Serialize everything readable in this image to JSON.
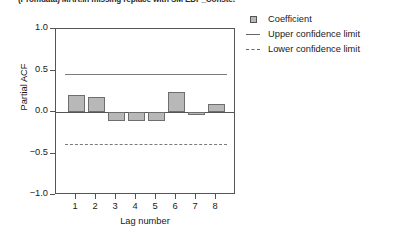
{
  "chart_data": {
    "type": "bar",
    "title": "(Promdata) MAR.ln missing replace with SM EDP_Conste.",
    "xlabel": "Lag number",
    "ylabel": "Partial ACF",
    "categories": [
      "1",
      "2",
      "3",
      "4",
      "5",
      "6",
      "7",
      "8"
    ],
    "values": [
      0.2,
      0.18,
      -0.11,
      -0.11,
      -0.11,
      0.24,
      -0.04,
      0.1
    ],
    "series": [
      {
        "name": "Coefficient",
        "values": [
          0.2,
          0.18,
          -0.11,
          -0.11,
          -0.11,
          0.24,
          -0.04,
          0.1
        ]
      }
    ],
    "ylim": [
      -1.0,
      1.0
    ],
    "yticks": [
      "1.0",
      "0.5",
      "0.0",
      "-0.5",
      "-1.0"
    ],
    "ytick_values": [
      1.0,
      0.5,
      0.0,
      -0.5,
      -1.0
    ],
    "xticks": [
      "1",
      "2",
      "3",
      "4",
      "5",
      "6",
      "7",
      "8"
    ],
    "grid": false,
    "legend_position": "right",
    "upper_confidence_limit": 0.46,
    "lower_confidence_limit": -0.38,
    "bar_color": "#b8b8b8",
    "bar_edge_color": "#6e6e6e",
    "limit_line_color": "#7a7a7a",
    "axis_color": "#555555"
  },
  "legend": {
    "items": [
      {
        "label": "Coefficient",
        "key": "box-swatch"
      },
      {
        "label": "Upper confidence limit",
        "key": "solid-line-swatch"
      },
      {
        "label": "Lower confidence limit",
        "key": "dashed-line-swatch"
      }
    ]
  }
}
